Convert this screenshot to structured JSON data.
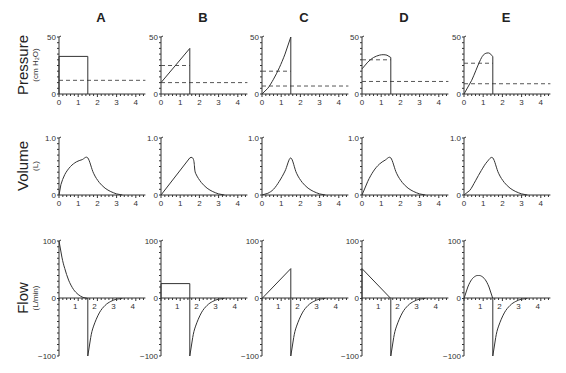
{
  "figure": {
    "columns": [
      "A",
      "B",
      "C",
      "D",
      "E"
    ],
    "rows": [
      {
        "label": "Pressure",
        "unit": "(cm H₂O)"
      },
      {
        "label": "Volume",
        "unit": "(L)"
      },
      {
        "label": "Flow",
        "unit": "(L/min)"
      }
    ],
    "x_ticks": [
      "0",
      "1",
      "2",
      "3",
      "4"
    ],
    "pressure_ticks": [
      "0",
      "50"
    ],
    "volume_ticks": [
      "0",
      "1.0"
    ],
    "flow_ticks": [
      "100",
      "0",
      "−100"
    ],
    "flow_x_ticks": [
      "1",
      "2",
      "3",
      "4"
    ]
  },
  "chart_data": [
    {
      "type": "line",
      "title": "Pressure (cm H2O)",
      "xlabel": "time (s)",
      "ylabel": "Pressure (cm H2O)",
      "xlim": [
        0,
        4.5
      ],
      "ylim": [
        0,
        50
      ],
      "panels": [
        {
          "column": "A",
          "series": [
            {
              "name": "airway pressure",
              "x": [
                0,
                0,
                1.5,
                1.5
              ],
              "y": [
                0,
                33,
                33,
                0
              ]
            }
          ],
          "dashed": [
            12
          ]
        },
        {
          "column": "B",
          "series": [
            {
              "name": "airway pressure",
              "x": [
                0,
                1.5,
                1.5
              ],
              "y": [
                10,
                40,
                0
              ]
            }
          ],
          "dashed": [
            25,
            10
          ]
        },
        {
          "column": "C",
          "series": [
            {
              "name": "airway pressure",
              "x": [
                0,
                0.3,
                0.6,
                0.9,
                1.2,
                1.5,
                1.5
              ],
              "y": [
                0,
                5,
                13,
                23,
                35,
                50,
                0
              ]
            }
          ],
          "dashed": [
            20,
            7
          ]
        },
        {
          "column": "D",
          "series": [
            {
              "name": "airway pressure",
              "x": [
                0,
                0.3,
                0.6,
                0.9,
                1.1,
                1.3,
                1.5,
                1.5
              ],
              "y": [
                22,
                28,
                32,
                34,
                34.5,
                34,
                32,
                0
              ]
            }
          ],
          "dashed": [
            30,
            11
          ]
        },
        {
          "column": "E",
          "series": [
            {
              "name": "airway pressure",
              "x": [
                0,
                0.4,
                0.8,
                1.0,
                1.2,
                1.35,
                1.5,
                1.5
              ],
              "y": [
                0,
                12,
                28,
                34,
                36,
                35.5,
                33,
                0
              ]
            }
          ],
          "dashed": [
            27,
            9
          ]
        }
      ]
    },
    {
      "type": "line",
      "title": "Volume (L)",
      "xlabel": "time (s)",
      "ylabel": "Volume (L)",
      "xlim": [
        0,
        4.5
      ],
      "ylim": [
        0,
        1.0
      ],
      "panels": [
        {
          "column": "A",
          "series": [
            {
              "name": "volume",
              "x": [
                0,
                0.1,
                0.3,
                0.6,
                0.9,
                1.2,
                1.5,
                1.8,
                2.1,
                2.4,
                2.7,
                3.0,
                3.3
              ],
              "y": [
                0,
                0.18,
                0.36,
                0.5,
                0.58,
                0.62,
                0.65,
                0.38,
                0.22,
                0.12,
                0.06,
                0.02,
                0
              ]
            }
          ]
        },
        {
          "column": "B",
          "series": [
            {
              "name": "volume",
              "x": [
                0,
                1.5,
                1.8,
                2.1,
                2.4,
                2.7,
                3.0,
                3.3
              ],
              "y": [
                0,
                0.65,
                0.38,
                0.22,
                0.12,
                0.06,
                0.02,
                0
              ]
            }
          ]
        },
        {
          "column": "C",
          "series": [
            {
              "name": "volume",
              "x": [
                0,
                0.3,
                0.6,
                0.9,
                1.2,
                1.5,
                1.8,
                2.1,
                2.4,
                2.7,
                3.0,
                3.3
              ],
              "y": [
                0,
                0.03,
                0.1,
                0.24,
                0.42,
                0.65,
                0.38,
                0.22,
                0.12,
                0.06,
                0.02,
                0
              ]
            }
          ]
        },
        {
          "column": "D",
          "series": [
            {
              "name": "volume",
              "x": [
                0,
                0.3,
                0.6,
                0.9,
                1.2,
                1.5,
                1.8,
                2.1,
                2.4,
                2.7,
                3.0,
                3.3
              ],
              "y": [
                0,
                0.24,
                0.42,
                0.54,
                0.61,
                0.65,
                0.38,
                0.22,
                0.12,
                0.06,
                0.02,
                0
              ]
            }
          ]
        },
        {
          "column": "E",
          "series": [
            {
              "name": "volume",
              "x": [
                0,
                0.3,
                0.6,
                0.9,
                1.2,
                1.5,
                1.8,
                2.1,
                2.4,
                2.7,
                3.0,
                3.3
              ],
              "y": [
                0,
                0.08,
                0.25,
                0.43,
                0.58,
                0.65,
                0.38,
                0.22,
                0.12,
                0.06,
                0.02,
                0
              ]
            }
          ]
        }
      ]
    },
    {
      "type": "line",
      "title": "Flow (L/min)",
      "xlabel": "time (s)",
      "ylabel": "Flow (L/min)",
      "xlim": [
        0,
        4.5
      ],
      "ylim": [
        -100,
        100
      ],
      "panels": [
        {
          "column": "A",
          "series": [
            {
              "name": "flow",
              "x": [
                0,
                0.15,
                0.3,
                0.5,
                0.75,
                1.0,
                1.25,
                1.5,
                1.5,
                1.65,
                1.8,
                2.1,
                2.4,
                2.7,
                3.0,
                3.3
              ],
              "y": [
                100,
                72,
                52,
                32,
                16,
                7,
                2,
                0,
                -100,
                -68,
                -48,
                -25,
                -12,
                -5,
                -1,
                0
              ]
            }
          ]
        },
        {
          "column": "B",
          "series": [
            {
              "name": "flow",
              "x": [
                0,
                0,
                1.5,
                1.5,
                1.65,
                1.8,
                2.1,
                2.4,
                2.7,
                3.0,
                3.3
              ],
              "y": [
                0,
                26,
                26,
                -100,
                -68,
                -48,
                -25,
                -12,
                -5,
                -1,
                0
              ]
            }
          ]
        },
        {
          "column": "C",
          "series": [
            {
              "name": "flow",
              "x": [
                0,
                1.5,
                1.5,
                1.65,
                1.8,
                2.1,
                2.4,
                2.7,
                3.0,
                3.3
              ],
              "y": [
                0,
                52,
                -100,
                -68,
                -48,
                -25,
                -12,
                -5,
                -1,
                0
              ]
            }
          ]
        },
        {
          "column": "D",
          "series": [
            {
              "name": "flow",
              "x": [
                0,
                0,
                1.5,
                1.5,
                1.65,
                1.8,
                2.1,
                2.4,
                2.7,
                3.0,
                3.3
              ],
              "y": [
                0,
                52,
                0,
                -100,
                -68,
                -48,
                -25,
                -12,
                -5,
                -1,
                0
              ]
            }
          ]
        },
        {
          "column": "E",
          "series": [
            {
              "name": "flow",
              "x": [
                0,
                0.2,
                0.4,
                0.6,
                0.75,
                0.9,
                1.1,
                1.3,
                1.5,
                1.5,
                1.65,
                1.8,
                2.1,
                2.4,
                2.7,
                3.0,
                3.3
              ],
              "y": [
                0,
                20,
                33,
                39,
                40,
                39,
                33,
                20,
                0,
                -100,
                -68,
                -48,
                -25,
                -12,
                -5,
                -1,
                0
              ]
            }
          ]
        }
      ]
    }
  ]
}
